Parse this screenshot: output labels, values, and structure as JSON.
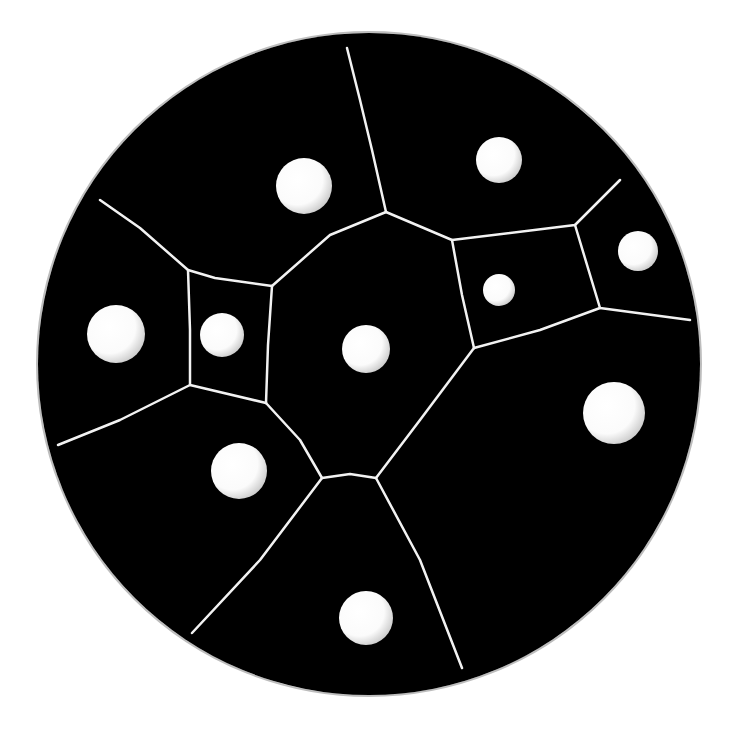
{
  "image": {
    "width": 738,
    "height": 732,
    "background": "#ffffff",
    "description": "Black circular dish divided into Voronoi-like cells by thin white lines, each cell containing a white circular seed"
  },
  "dish": {
    "cx": 369,
    "cy": 364,
    "r": 331,
    "fill": "#000000",
    "rim": "#bdbdbd"
  },
  "seeds": [
    {
      "cx": 304,
      "cy": 186,
      "r": 28
    },
    {
      "cx": 499,
      "cy": 160,
      "r": 23
    },
    {
      "cx": 638,
      "cy": 251,
      "r": 20
    },
    {
      "cx": 499,
      "cy": 290,
      "r": 16
    },
    {
      "cx": 116,
      "cy": 334,
      "r": 29
    },
    {
      "cx": 222,
      "cy": 335,
      "r": 22
    },
    {
      "cx": 366,
      "cy": 349,
      "r": 24
    },
    {
      "cx": 614,
      "cy": 413,
      "r": 31
    },
    {
      "cx": 239,
      "cy": 471,
      "r": 28
    },
    {
      "cx": 366,
      "cy": 618,
      "r": 27
    }
  ],
  "boundaries": [
    [
      [
        347,
        48
      ],
      [
        360,
        100
      ],
      [
        372,
        150
      ],
      [
        386,
        212
      ]
    ],
    [
      [
        100,
        200
      ],
      [
        140,
        228
      ],
      [
        188,
        270
      ],
      [
        215,
        278
      ],
      [
        272,
        286
      ]
    ],
    [
      [
        386,
        212
      ],
      [
        330,
        235
      ],
      [
        272,
        286
      ]
    ],
    [
      [
        386,
        212
      ],
      [
        452,
        240
      ],
      [
        575,
        225
      ],
      [
        620,
        180
      ]
    ],
    [
      [
        452,
        240
      ],
      [
        462,
        295
      ],
      [
        474,
        348
      ]
    ],
    [
      [
        575,
        225
      ],
      [
        600,
        308
      ],
      [
        690,
        320
      ]
    ],
    [
      [
        474,
        348
      ],
      [
        540,
        330
      ],
      [
        600,
        308
      ]
    ],
    [
      [
        188,
        270
      ],
      [
        190,
        330
      ],
      [
        190,
        385
      ],
      [
        266,
        403
      ]
    ],
    [
      [
        272,
        286
      ],
      [
        268,
        345
      ],
      [
        266,
        403
      ]
    ],
    [
      [
        266,
        403
      ],
      [
        300,
        440
      ],
      [
        322,
        478
      ]
    ],
    [
      [
        474,
        348
      ],
      [
        420,
        420
      ],
      [
        376,
        478
      ]
    ],
    [
      [
        322,
        478
      ],
      [
        350,
        474
      ],
      [
        376,
        478
      ]
    ],
    [
      [
        190,
        385
      ],
      [
        120,
        420
      ],
      [
        58,
        445
      ]
    ],
    [
      [
        322,
        478
      ],
      [
        260,
        560
      ],
      [
        192,
        633
      ]
    ],
    [
      [
        376,
        478
      ],
      [
        420,
        560
      ],
      [
        462,
        668
      ]
    ]
  ],
  "colors": {
    "cell": "#000000",
    "boundary": "#f2f2f2",
    "seed": "#ffffff",
    "seed_shade": "#cfcfcf"
  }
}
